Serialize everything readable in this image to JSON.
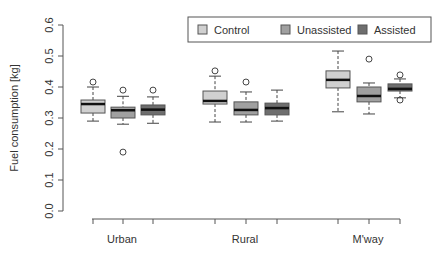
{
  "chart_data": {
    "type": "boxplot",
    "title": "",
    "xlabel": "",
    "ylabel": "Fuel consumption [kg]",
    "ylim": [
      0.0,
      0.6
    ],
    "yticks": [
      "0.0",
      "0.1",
      "0.2",
      "0.3",
      "0.4",
      "0.5",
      "0.6"
    ],
    "grid": false,
    "legend_position": "top-right",
    "categories": [
      "Urban",
      "Rural",
      "M'way"
    ],
    "series": [
      {
        "name": "Control",
        "color": "#d0d0d0",
        "boxes": [
          {
            "low": 0.29,
            "q1": 0.316,
            "median": 0.345,
            "q3": 0.358,
            "high": 0.4,
            "outliers": [
              0.416
            ]
          },
          {
            "low": 0.287,
            "q1": 0.345,
            "median": 0.355,
            "q3": 0.387,
            "high": 0.435,
            "outliers": [
              0.452
            ]
          },
          {
            "low": 0.32,
            "q1": 0.397,
            "median": 0.423,
            "q3": 0.452,
            "high": 0.516,
            "outliers": []
          }
        ]
      },
      {
        "name": "Unassisted",
        "color": "#a0a0a0",
        "boxes": [
          {
            "low": 0.28,
            "q1": 0.3,
            "median": 0.325,
            "q3": 0.335,
            "high": 0.37,
            "outliers": [
              0.39,
              0.19
            ]
          },
          {
            "low": 0.287,
            "q1": 0.31,
            "median": 0.326,
            "q3": 0.352,
            "high": 0.384,
            "outliers": [
              0.416
            ]
          },
          {
            "low": 0.313,
            "q1": 0.352,
            "median": 0.371,
            "q3": 0.4,
            "high": 0.413,
            "outliers": [
              0.49
            ]
          }
        ]
      },
      {
        "name": "Assisted",
        "color": "#6e6e6e",
        "boxes": [
          {
            "low": 0.283,
            "q1": 0.31,
            "median": 0.327,
            "q3": 0.342,
            "high": 0.368,
            "outliers": [
              0.39
            ]
          },
          {
            "low": 0.29,
            "q1": 0.31,
            "median": 0.332,
            "q3": 0.348,
            "high": 0.39,
            "outliers": []
          },
          {
            "low": 0.365,
            "q1": 0.387,
            "median": 0.394,
            "q3": 0.41,
            "high": 0.426,
            "outliers": [
              0.439,
              0.358
            ]
          }
        ]
      }
    ]
  },
  "legend": {
    "items": [
      {
        "label": "Control",
        "color": "#d0d0d0"
      },
      {
        "label": "Unassisted",
        "color": "#a0a0a0"
      },
      {
        "label": "Assisted",
        "color": "#6e6e6e"
      }
    ]
  }
}
